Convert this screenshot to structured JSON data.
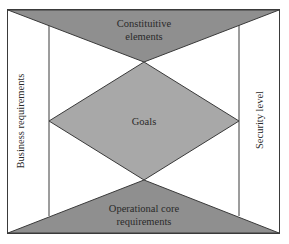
{
  "diagram": {
    "colors": {
      "fill_dark": "#8f8f8f",
      "fill_mid": "#a8a8a8",
      "stroke": "#3a3a3a",
      "background": "#ffffff"
    },
    "top_triangle": {
      "lines": [
        "Constituitive",
        "elements"
      ]
    },
    "center_diamond": {
      "label": "Goals"
    },
    "bottom_triangle": {
      "lines": [
        "Operational core",
        "requirements"
      ]
    },
    "left_label": "Business requirements",
    "right_label": "Security level"
  }
}
